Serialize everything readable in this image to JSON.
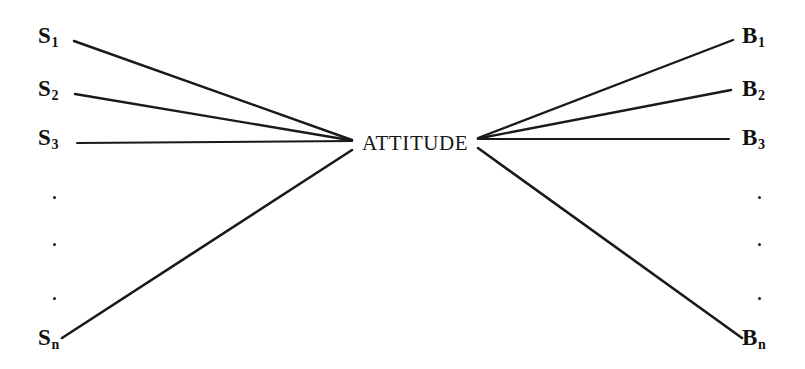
{
  "diagram": {
    "type": "fan-convergence-diagram",
    "background_color": "#ffffff",
    "line_color": "#1a1a1a",
    "text_color": "#111111",
    "width": 805,
    "height": 369,
    "center": {
      "label": "ATTITUDE",
      "x": 362,
      "y": 133,
      "left_anchor_x": 352,
      "left_anchor_y": 141,
      "right_anchor_x": 478,
      "right_anchor_y": 139
    },
    "left_nodes": [
      {
        "base": "S",
        "subscript": "1",
        "label": "S1",
        "label_x": 38,
        "label_y": 24,
        "line_x": 74,
        "line_y": 41
      },
      {
        "base": "S",
        "subscript": "2",
        "label": "S2",
        "label_x": 38,
        "label_y": 77,
        "line_x": 75,
        "line_y": 94
      },
      {
        "base": "S",
        "subscript": "3",
        "label": "S3",
        "label_x": 38,
        "label_y": 126,
        "line_x": 77,
        "line_y": 143
      },
      {
        "base": "S",
        "subscript": "n",
        "label": "Sn",
        "label_x": 38,
        "label_y": 326,
        "line_x": 62,
        "line_y": 338
      }
    ],
    "right_nodes": [
      {
        "base": "B",
        "subscript": "1",
        "label": "B1",
        "label_x": 742,
        "label_y": 24,
        "line_x": 733,
        "line_y": 40
      },
      {
        "base": "B",
        "subscript": "2",
        "label": "B2",
        "label_x": 742,
        "label_y": 77,
        "line_x": 731,
        "line_y": 90
      },
      {
        "base": "B",
        "subscript": "3",
        "label": "B3",
        "label_x": 742,
        "label_y": 126,
        "line_x": 729,
        "line_y": 139
      },
      {
        "base": "B",
        "subscript": "n",
        "label": "Bn",
        "label_x": 742,
        "label_y": 326,
        "line_x": 742,
        "line_y": 338
      }
    ],
    "left_ellipsis": [
      {
        "x": 53,
        "y": 196
      },
      {
        "x": 53,
        "y": 243
      },
      {
        "x": 53,
        "y": 297
      }
    ],
    "right_ellipsis": [
      {
        "x": 758,
        "y": 196
      },
      {
        "x": 758,
        "y": 243
      },
      {
        "x": 758,
        "y": 297
      }
    ]
  }
}
